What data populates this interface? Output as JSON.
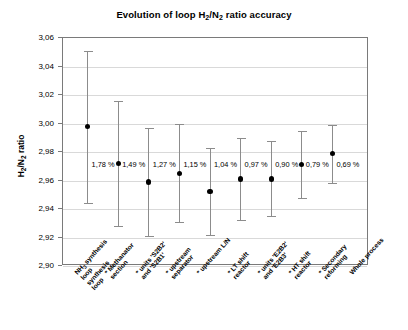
{
  "chart_data": {
    "type": "scatter",
    "title": "Evolution of loop H2/N2 ratio accuracy",
    "title_parts": {
      "pre": "Evolution of loop H",
      "sub1": "2",
      "mid": "/N",
      "sub2": "2",
      "post": " ratio accuracy"
    },
    "xlabel": "",
    "ylabel": "H2/N2 ratio",
    "ylabel_parts": {
      "pre": "H",
      "sub1": "2",
      "mid": "/N",
      "sub2": "2",
      "post": " ratio"
    },
    "ylim": [
      2.9,
      3.06
    ],
    "ytick_labels": [
      "3,06",
      "3,04",
      "3,02",
      "3,00",
      "2,98",
      "2,96",
      "2,94",
      "2,92",
      "2,90"
    ],
    "ytick_values": [
      3.06,
      3.04,
      3.02,
      3.0,
      2.98,
      2.96,
      2.94,
      2.92,
      2.9
    ],
    "grid": true,
    "legend": "none",
    "decimal_separator": ",",
    "categories": [
      "NH3 synthesis loop",
      "* Methanator section",
      "* units 'S2B2' and 'S2B1'",
      "* upstream separator",
      "* upstream L/N",
      "* LT shift reactor",
      "* units 'E2B2' and 'E2B3'",
      "* HT shift reactor",
      "* Secondary reforming",
      "Whole process"
    ],
    "category_lines": [
      [
        "NH",
        "3",
        " synthesis",
        "loop"
      ],
      [
        "* Methanator",
        "section"
      ],
      [
        "* units 'S2B2'",
        "and 'S2B1'"
      ],
      [
        "* upstream",
        "separator"
      ],
      [
        "* upstream L/N",
        ""
      ],
      [
        "* LT shift",
        "reactor"
      ],
      [
        "* units 'E2B2'",
        "and 'E2B3'"
      ],
      [
        "* HT shift",
        "reactor"
      ],
      [
        "* Secondary",
        "reforming"
      ],
      [
        "Whole process",
        ""
      ]
    ],
    "points": [
      {
        "label": "1,78 %",
        "value": 2.998,
        "lower": 2.944,
        "upper": 3.051,
        "accuracy_pct": 1.78
      },
      {
        "label": "1,49 %",
        "value": 2.972,
        "lower": 2.928,
        "upper": 3.016,
        "accuracy_pct": 1.49
      },
      {
        "label": "1,27 %",
        "value": 2.959,
        "lower": 2.921,
        "upper": 2.997,
        "accuracy_pct": 1.27
      },
      {
        "label": "1,15 %",
        "value": 2.965,
        "lower": 2.931,
        "upper": 3.0,
        "accuracy_pct": 1.15
      },
      {
        "label": "1,04 %",
        "value": 2.952,
        "lower": 2.922,
        "upper": 2.983,
        "accuracy_pct": 1.04
      },
      {
        "label": "0,97 %",
        "value": 2.961,
        "lower": 2.932,
        "upper": 2.99,
        "accuracy_pct": 0.97
      },
      {
        "label": "0,90 %",
        "value": 2.961,
        "lower": 2.935,
        "upper": 2.988,
        "accuracy_pct": 0.9
      },
      {
        "label": "0,79 %",
        "value": 2.971,
        "lower": 2.948,
        "upper": 2.995,
        "accuracy_pct": 0.79
      },
      {
        "label": "0,69 %",
        "value": 2.979,
        "lower": 2.958,
        "upper": 2.999,
        "accuracy_pct": 0.69
      }
    ]
  },
  "colors": {
    "background": "#ffffff",
    "frame": "#7a7a7a",
    "gridline": "#d9d9d9",
    "whisker": "#8c8c8c",
    "marker": "#000000",
    "text": "#000000"
  }
}
